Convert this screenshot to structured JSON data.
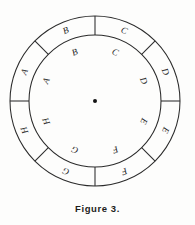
{
  "figure": {
    "caption": "Figure 3.",
    "geometry": {
      "center_x": 95,
      "center_y": 101,
      "outer_radius": 85,
      "ring_inner_radius": 66,
      "inner_label_radius": 52,
      "ring_label_radius": 75.5,
      "center_dot_radius": 2.0,
      "sector_count": 8,
      "divider_angles_deg": [
        0,
        45,
        90,
        135,
        180,
        225,
        270,
        315
      ]
    },
    "colors": {
      "stroke": "#2b2b2b",
      "text": "#262626",
      "center_dot": "#141414",
      "background": "#fdfdfc"
    },
    "outer_ring": {
      "name": "outer-ring-sectors",
      "has_dividers": true,
      "segments": [
        {
          "label": "A",
          "angle_deg": 292.5
        },
        {
          "label": "B",
          "angle_deg": 337.5
        },
        {
          "label": "C",
          "angle_deg": 22.5
        },
        {
          "label": "D",
          "angle_deg": 67.5
        },
        {
          "label": "E",
          "angle_deg": 112.5
        },
        {
          "label": "F",
          "angle_deg": 157.5
        },
        {
          "label": "G",
          "angle_deg": 202.5
        },
        {
          "label": "H",
          "angle_deg": 247.5
        }
      ]
    },
    "inner_disc": {
      "name": "inner-disc-labels",
      "has_dividers": false,
      "segments": [
        {
          "label": "A",
          "angle_deg": 292.5
        },
        {
          "label": "B",
          "angle_deg": 337.5
        },
        {
          "label": "C",
          "angle_deg": 22.5
        },
        {
          "label": "D",
          "angle_deg": 67.5
        },
        {
          "label": "E",
          "angle_deg": 112.5
        },
        {
          "label": "F",
          "angle_deg": 157.5
        },
        {
          "label": "G",
          "angle_deg": 202.5
        },
        {
          "label": "H",
          "angle_deg": 247.5
        }
      ]
    }
  }
}
